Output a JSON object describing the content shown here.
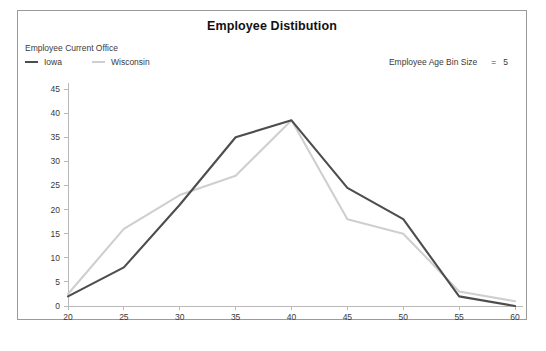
{
  "chart_data": {
    "type": "line",
    "title": "Employee Distibution",
    "xlabel": "Age",
    "ylabel": "",
    "x": [
      20,
      25,
      30,
      35,
      40,
      45,
      50,
      55,
      60
    ],
    "xlim": [
      20,
      60
    ],
    "ylim": [
      0,
      45
    ],
    "xticks": [
      "20",
      "25",
      "30",
      "35",
      "40",
      "45",
      "50",
      "55",
      "60"
    ],
    "yticks": [
      "0",
      "5",
      "10",
      "15",
      "20",
      "25",
      "30",
      "35",
      "40",
      "45"
    ],
    "grid": false,
    "legend_position": "top-left",
    "legend_title": "Employee Current Office",
    "series": [
      {
        "name": "Iowa",
        "color": "#4d4d4d",
        "values": [
          2,
          8,
          21,
          35,
          38.5,
          24.5,
          18,
          2,
          0
        ]
      },
      {
        "name": "Wisconsin",
        "color": "#cfcfcf",
        "values": [
          2.5,
          16,
          23,
          27,
          38.5,
          18,
          15,
          3,
          1
        ]
      }
    ],
    "annotations": [
      {
        "label": "Employee Age Bin Size",
        "equals": "=",
        "value": "5"
      }
    ]
  }
}
